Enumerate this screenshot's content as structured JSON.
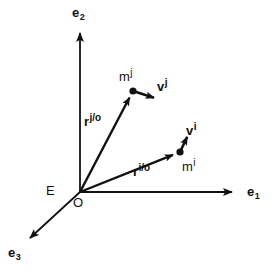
{
  "figure": {
    "type": "vector-diagram",
    "background_color": "#ffffff",
    "stroke_color": "#111111",
    "text_color": "#111111",
    "width": 272,
    "height": 277,
    "axes": [
      {
        "id": "e1",
        "name": "e",
        "subscript": "1",
        "label": "e1",
        "from": [
          80,
          192
        ],
        "to": [
          240,
          192
        ],
        "label_pos": [
          247,
          185
        ]
      },
      {
        "id": "e2",
        "name": "e",
        "subscript": "2",
        "label": "e2",
        "from": [
          80,
          192
        ],
        "to": [
          80,
          25
        ],
        "label_pos": [
          72,
          6
        ]
      },
      {
        "id": "e3",
        "name": "e",
        "subscript": "3",
        "label": "e3",
        "from": [
          80,
          192
        ],
        "to": [
          24,
          244
        ],
        "label_pos": [
          8,
          246
        ]
      }
    ],
    "origin": {
      "point": [
        80,
        192
      ],
      "label": "O",
      "label_pos": [
        73,
        196
      ]
    },
    "frame": {
      "label": "E",
      "label_pos": [
        46,
        184
      ]
    },
    "particles": [
      {
        "id": "mj",
        "base": "m",
        "superscript": "j",
        "label": "mj",
        "point": [
          133,
          91
        ],
        "label_pos": [
          119,
          68
        ],
        "position_vector": {
          "base": "r",
          "superscript": "j/o",
          "label": "rj/o",
          "from": [
            80,
            192
          ],
          "to": [
            133,
            91
          ],
          "label_pos": [
            84,
            113
          ]
        },
        "velocity_vector": {
          "base": "v",
          "superscript": "j",
          "label": "vj",
          "from": [
            133,
            91
          ],
          "to": [
            161,
            100
          ],
          "label_pos": [
            157,
            78
          ]
        }
      },
      {
        "id": "mi",
        "base": "m",
        "superscript": "i",
        "label": "mi",
        "point": [
          180,
          152
        ],
        "label_pos": [
          180,
          152
        ],
        "position_vector": {
          "base": "r",
          "superscript": "i/o",
          "label": "ri/o",
          "from": [
            80,
            192
          ],
          "to": [
            180,
            152
          ],
          "label_pos": [
            133,
            163
          ]
        },
        "velocity_vector": {
          "base": "v",
          "superscript": "i",
          "label": "vi",
          "from": [
            180,
            152
          ],
          "to": [
            191,
            129
          ],
          "label_pos": [
            186,
            122
          ]
        }
      }
    ]
  }
}
